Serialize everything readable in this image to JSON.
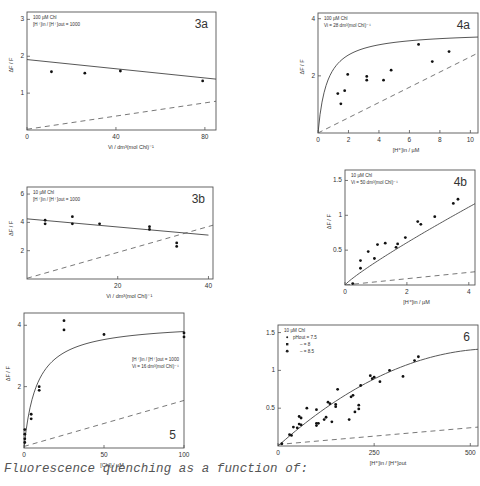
{
  "caption": "Fluorescence quenching as a function of:",
  "chart_data": [
    {
      "id": "3a",
      "type": "scatter",
      "panel_label": "3a",
      "annotations": [
        "100 µM Chl",
        "[H⁺]in / [H⁺]out = 1000"
      ],
      "xlabel": "Vi / dm³(mol Chl)⁻¹",
      "ylabel": "ΔF / F",
      "xlim": [
        0,
        85
      ],
      "ylim": [
        0,
        3.2
      ],
      "xticks": [
        0,
        40,
        80
      ],
      "yticks": [
        1,
        2,
        3
      ],
      "frame": {
        "x": 27,
        "y": 12,
        "w": 189,
        "h": 118
      },
      "points": [
        [
          11,
          1.58
        ],
        [
          26,
          1.54
        ],
        [
          42,
          1.6
        ],
        [
          79,
          1.33
        ]
      ],
      "solid_curve": [
        [
          0,
          1.91
        ],
        [
          85,
          1.38
        ]
      ],
      "dashed_curve": [
        [
          0,
          0.02
        ],
        [
          85,
          0.78
        ]
      ]
    },
    {
      "id": "4a",
      "type": "scatter",
      "panel_label": "4a",
      "annotations": [
        "100 µM Chl",
        "Vi = 28 dm³(mol Chl)⁻¹"
      ],
      "xlabel": "[H⁺]in / µM",
      "ylabel": "ΔF / F",
      "xlim": [
        0,
        10.5
      ],
      "ylim": [
        0,
        4.2
      ],
      "xticks": [
        0,
        2,
        4,
        6,
        8,
        10
      ],
      "yticks": [
        2,
        4
      ],
      "frame": {
        "x": 318,
        "y": 13,
        "w": 160,
        "h": 120
      },
      "points": [
        [
          1.3,
          1.38
        ],
        [
          1.5,
          1.02
        ],
        [
          1.75,
          1.48
        ],
        [
          1.95,
          2.05
        ],
        [
          3.2,
          1.98
        ],
        [
          3.2,
          1.85
        ],
        [
          4.3,
          1.85
        ],
        [
          4.8,
          2.2
        ],
        [
          6.6,
          3.1
        ],
        [
          7.5,
          2.5
        ],
        [
          8.6,
          2.85
        ]
      ],
      "solid_curve": "hyperbolic: y = 3.55*x/(x+0.6)",
      "dashed_curve": [
        [
          0,
          0
        ],
        [
          10.5,
          2.8
        ]
      ]
    },
    {
      "id": "3b",
      "type": "scatter",
      "panel_label": "3b",
      "annotations": [
        "10 µM Chl",
        "[H⁺]in / [H⁺]out = 1000"
      ],
      "xlabel": "Vi / dm³(mol Chl)⁻¹",
      "ylabel": "ΔF / F",
      "xlim": [
        0,
        41
      ],
      "ylim": [
        0,
        6.5
      ],
      "xticks": [
        20,
        40
      ],
      "yticks": [
        2,
        4,
        6
      ],
      "frame": {
        "x": 27,
        "y": 187,
        "w": 186,
        "h": 92
      },
      "points": [
        [
          4,
          4.15
        ],
        [
          4,
          3.9
        ],
        [
          10,
          4.4
        ],
        [
          10,
          3.9
        ],
        [
          16,
          3.9
        ],
        [
          27,
          3.7
        ],
        [
          27,
          3.5
        ],
        [
          33,
          2.55
        ],
        [
          33,
          2.3
        ]
      ],
      "solid_curve": [
        [
          0,
          4.25
        ],
        [
          40,
          3.1
        ]
      ],
      "dashed_curve": [
        [
          0,
          0.05
        ],
        [
          41,
          3.8
        ]
      ]
    },
    {
      "id": "4b",
      "type": "scatter",
      "panel_label": "4b",
      "annotations": [
        "10 µM Chl",
        "Vi = 50 dm³(mol Chl)⁻¹"
      ],
      "xlabel": "[H⁺]in / µM",
      "ylabel": "ΔF / F",
      "xlim": [
        0,
        4.2
      ],
      "ylim": [
        0,
        1.65
      ],
      "xticks": [
        0,
        2,
        4
      ],
      "yticks": [
        0.5,
        1,
        1.5
      ],
      "frame": {
        "x": 345,
        "y": 170,
        "w": 130,
        "h": 115
      },
      "points": [
        [
          0.25,
          0.02
        ],
        [
          0.5,
          0.35
        ],
        [
          0.5,
          0.24
        ],
        [
          0.75,
          0.48
        ],
        [
          0.95,
          0.38
        ],
        [
          1.05,
          0.58
        ],
        [
          1.3,
          0.6
        ],
        [
          1.65,
          0.54
        ],
        [
          1.7,
          0.59
        ],
        [
          1.95,
          0.68
        ],
        [
          2.35,
          0.91
        ],
        [
          2.45,
          0.87
        ],
        [
          2.9,
          0.98
        ],
        [
          3.5,
          1.17
        ],
        [
          3.65,
          1.23
        ]
      ],
      "solid_curve": "y = 0.3*x^0.95 approx; (0,0)->(4.2,1.15)",
      "dashed_curve": [
        [
          0,
          0
        ],
        [
          4.2,
          0.19
        ]
      ]
    },
    {
      "id": "5",
      "type": "scatter",
      "panel_label": "5",
      "annotations": [
        "[H⁺]in / [H⁺]out = 1000",
        "Vi = 16 dm³(mol Chl)⁻¹"
      ],
      "xlabel": "[Chl] / µM",
      "ylabel": "ΔF / F",
      "xlim": [
        0,
        100
      ],
      "ylim": [
        0,
        4.4
      ],
      "xticks": [
        0,
        50,
        100
      ],
      "yticks": [
        2,
        4
      ],
      "frame": {
        "x": 24,
        "y": 313,
        "w": 160,
        "h": 135
      },
      "points": [
        [
          0.5,
          0.6
        ],
        [
          0.5,
          0.45
        ],
        [
          0.5,
          0.3
        ],
        [
          0.5,
          0.18
        ],
        [
          4.5,
          1.1
        ],
        [
          4.5,
          0.95
        ],
        [
          9.5,
          2.0
        ],
        [
          9.5,
          1.88
        ],
        [
          25,
          4.15
        ],
        [
          25,
          3.85
        ],
        [
          50,
          3.7
        ],
        [
          100,
          3.75
        ],
        [
          100,
          3.62
        ]
      ],
      "solid_curve": "hyperbolic: y = 4.1*x/(x+8)",
      "dashed_curve": [
        [
          0,
          0.05
        ],
        [
          100,
          1.55
        ]
      ]
    },
    {
      "id": "6",
      "type": "scatter",
      "panel_label": "6",
      "annotations": [
        "10 µM Chl"
      ],
      "legend": [
        {
          "marker": "dot-small",
          "label": "pHout = 7.5"
        },
        {
          "marker": "square",
          "label": "= 8"
        },
        {
          "marker": "dot",
          "label": "= 8.5"
        }
      ],
      "xlabel": "[H⁺]in / [H⁺]out",
      "ylabel": "",
      "xlim": [
        0,
        520
      ],
      "ylim": [
        0,
        1.6
      ],
      "xticks": [
        0,
        250,
        500
      ],
      "yticks": [
        0.5,
        1,
        1.5
      ],
      "frame": {
        "x": 278,
        "y": 325,
        "w": 200,
        "h": 121
      },
      "points": [
        [
          10,
          0.03
        ],
        [
          30,
          0.15
        ],
        [
          35,
          0.14
        ],
        [
          40,
          0.25
        ],
        [
          50,
          0.24
        ],
        [
          55,
          0.29
        ],
        [
          55,
          0.39
        ],
        [
          60,
          0.37
        ],
        [
          60,
          0.28
        ],
        [
          75,
          0.5
        ],
        [
          100,
          0.48
        ],
        [
          100,
          0.3
        ],
        [
          100,
          0.27
        ],
        [
          105,
          0.3
        ],
        [
          120,
          0.35
        ],
        [
          125,
          0.38
        ],
        [
          130,
          0.58
        ],
        [
          135,
          0.56
        ],
        [
          140,
          0.32
        ],
        [
          150,
          0.55
        ],
        [
          150,
          0.52
        ],
        [
          155,
          0.75
        ],
        [
          185,
          0.35
        ],
        [
          190,
          0.65
        ],
        [
          195,
          0.67
        ],
        [
          200,
          0.45
        ],
        [
          210,
          0.54
        ],
        [
          210,
          0.49
        ],
        [
          215,
          0.8
        ],
        [
          240,
          0.93
        ],
        [
          245,
          0.89
        ],
        [
          250,
          0.91
        ],
        [
          265,
          0.85
        ],
        [
          290,
          1.0
        ],
        [
          325,
          0.92
        ],
        [
          355,
          1.13
        ],
        [
          365,
          1.18
        ]
      ],
      "solid_curve": "concave: (0,0)->(250,0.88)->(520,1.28)",
      "dashed_curve": [
        [
          0,
          0.02
        ],
        [
          520,
          0.25
        ]
      ]
    }
  ]
}
